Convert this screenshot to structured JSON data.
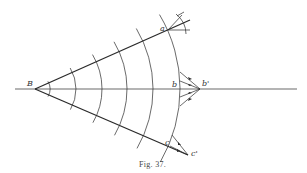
{
  "figure": {
    "caption": "Fig. 37.",
    "labels": {
      "vertex": "B",
      "point_a": "a",
      "point_b": "b",
      "point_b_prime": "b'",
      "point_c": "c",
      "point_c_prime": "c'"
    }
  }
}
